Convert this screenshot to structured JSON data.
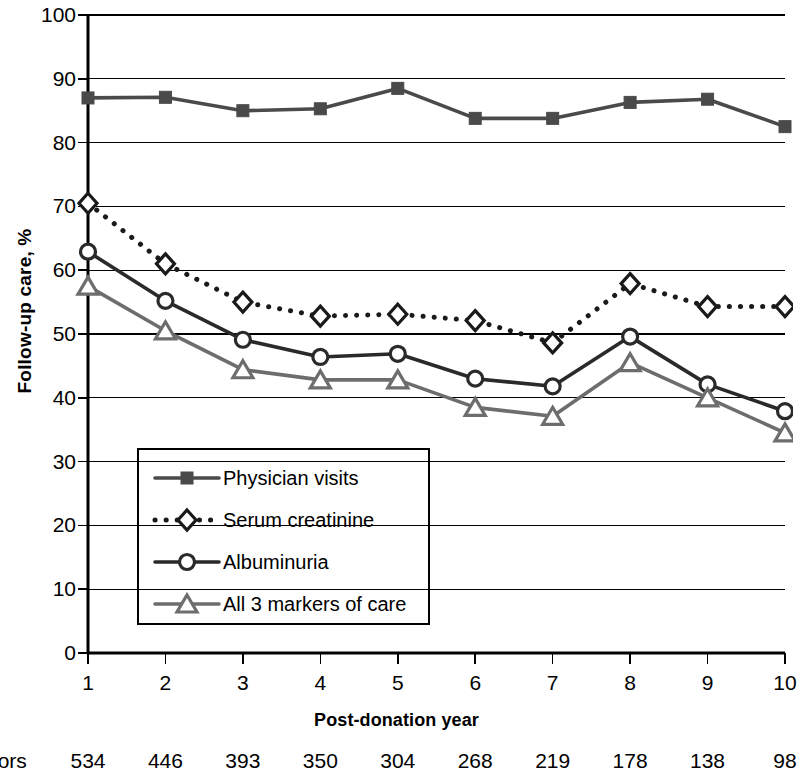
{
  "chart_data": {
    "type": "line",
    "title": "",
    "xlabel": "Post-donation year",
    "ylabel": "Follow-up care, %",
    "x": [
      1,
      2,
      3,
      4,
      5,
      6,
      7,
      8,
      9,
      10
    ],
    "xticklabels": [
      "1",
      "2",
      "3",
      "4",
      "5",
      "6",
      "7",
      "8",
      "9",
      "10"
    ],
    "yticklabels": [
      "0",
      "10",
      "20",
      "30",
      "40",
      "50",
      "60",
      "70",
      "80",
      "90",
      "100"
    ],
    "yticks": [
      0,
      10,
      20,
      30,
      40,
      50,
      60,
      70,
      80,
      90,
      100
    ],
    "ylim": [
      0,
      100
    ],
    "xlim": [
      1,
      10
    ],
    "grid": "horizontal",
    "legend_position": "inside-lower-left",
    "series": [
      {
        "name": "Physician visits",
        "marker": "filled-square",
        "linestyle": "solid",
        "color": "#4a4a4a",
        "values": [
          87.0,
          87.1,
          85.0,
          85.3,
          88.5,
          83.8,
          83.8,
          86.3,
          86.8,
          82.5
        ]
      },
      {
        "name": "Serum creatinine",
        "marker": "open-diamond",
        "linestyle": "dotted",
        "color": "#1a1a1a",
        "values": [
          70.5,
          61.0,
          55.0,
          52.8,
          53.1,
          52.1,
          48.6,
          57.9,
          54.3,
          54.3
        ]
      },
      {
        "name": "Albuminuria",
        "marker": "open-circle",
        "linestyle": "solid",
        "color": "#2a2a2a",
        "values": [
          62.9,
          55.2,
          49.1,
          46.4,
          46.9,
          43.0,
          41.8,
          49.6,
          42.1,
          37.9
        ]
      },
      {
        "name": "All 3 markers of care",
        "marker": "open-triangle",
        "linestyle": "solid",
        "color": "#6d6d6d",
        "values": [
          57.5,
          50.5,
          44.4,
          42.8,
          42.8,
          38.5,
          37.1,
          45.5,
          40.0,
          34.5
        ]
      }
    ]
  },
  "footer": {
    "label": "nors",
    "counts": [
      "534",
      "446",
      "393",
      "350",
      "304",
      "268",
      "219",
      "178",
      "138",
      "98"
    ]
  },
  "legend": {
    "items": [
      {
        "label": "Physician visits"
      },
      {
        "label": "Serum creatinine"
      },
      {
        "label": "Albuminuria"
      },
      {
        "label": "All 3 markers of care"
      }
    ]
  }
}
